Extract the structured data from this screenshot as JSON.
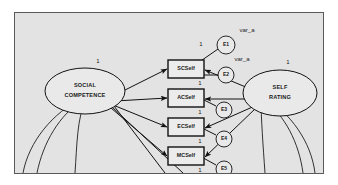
{
  "diagram": {
    "type": "structural-equation-model-path-diagram",
    "background_color": "#e3e3e3",
    "border_color": "#5a5a5a",
    "latent_variables": [
      {
        "id": "social-competence",
        "label_line1": "SOCIAL",
        "label_line2": "COMPETENCE",
        "coefficient": "1"
      },
      {
        "id": "self-rating",
        "label_line1": "SELF",
        "label_line2": "RATING",
        "coefficient": "1"
      }
    ],
    "indicators": [
      {
        "id": "scself",
        "label": "SCSelf",
        "coefficient": "1"
      },
      {
        "id": "acself",
        "label": "ACSelf",
        "coefficient": "1"
      },
      {
        "id": "ecself",
        "label": "ECSelf",
        "coefficient": "1"
      },
      {
        "id": "mcself",
        "label": "MCSelf",
        "coefficient": "1"
      }
    ],
    "errors": [
      {
        "id": "e1",
        "label": "E1",
        "coefficient": "1"
      },
      {
        "id": "e2",
        "label": "E2",
        "coefficient": "1"
      },
      {
        "id": "e3",
        "label": "E3",
        "coefficient": "1"
      },
      {
        "id": "e4",
        "label": "E4",
        "coefficient": "1"
      },
      {
        "id": "e5",
        "label": "E5",
        "coefficient": "1"
      }
    ],
    "annotations": [
      {
        "id": "var-a-top",
        "label": "var_a"
      },
      {
        "id": "var-a-second",
        "label": "var_a"
      }
    ]
  }
}
